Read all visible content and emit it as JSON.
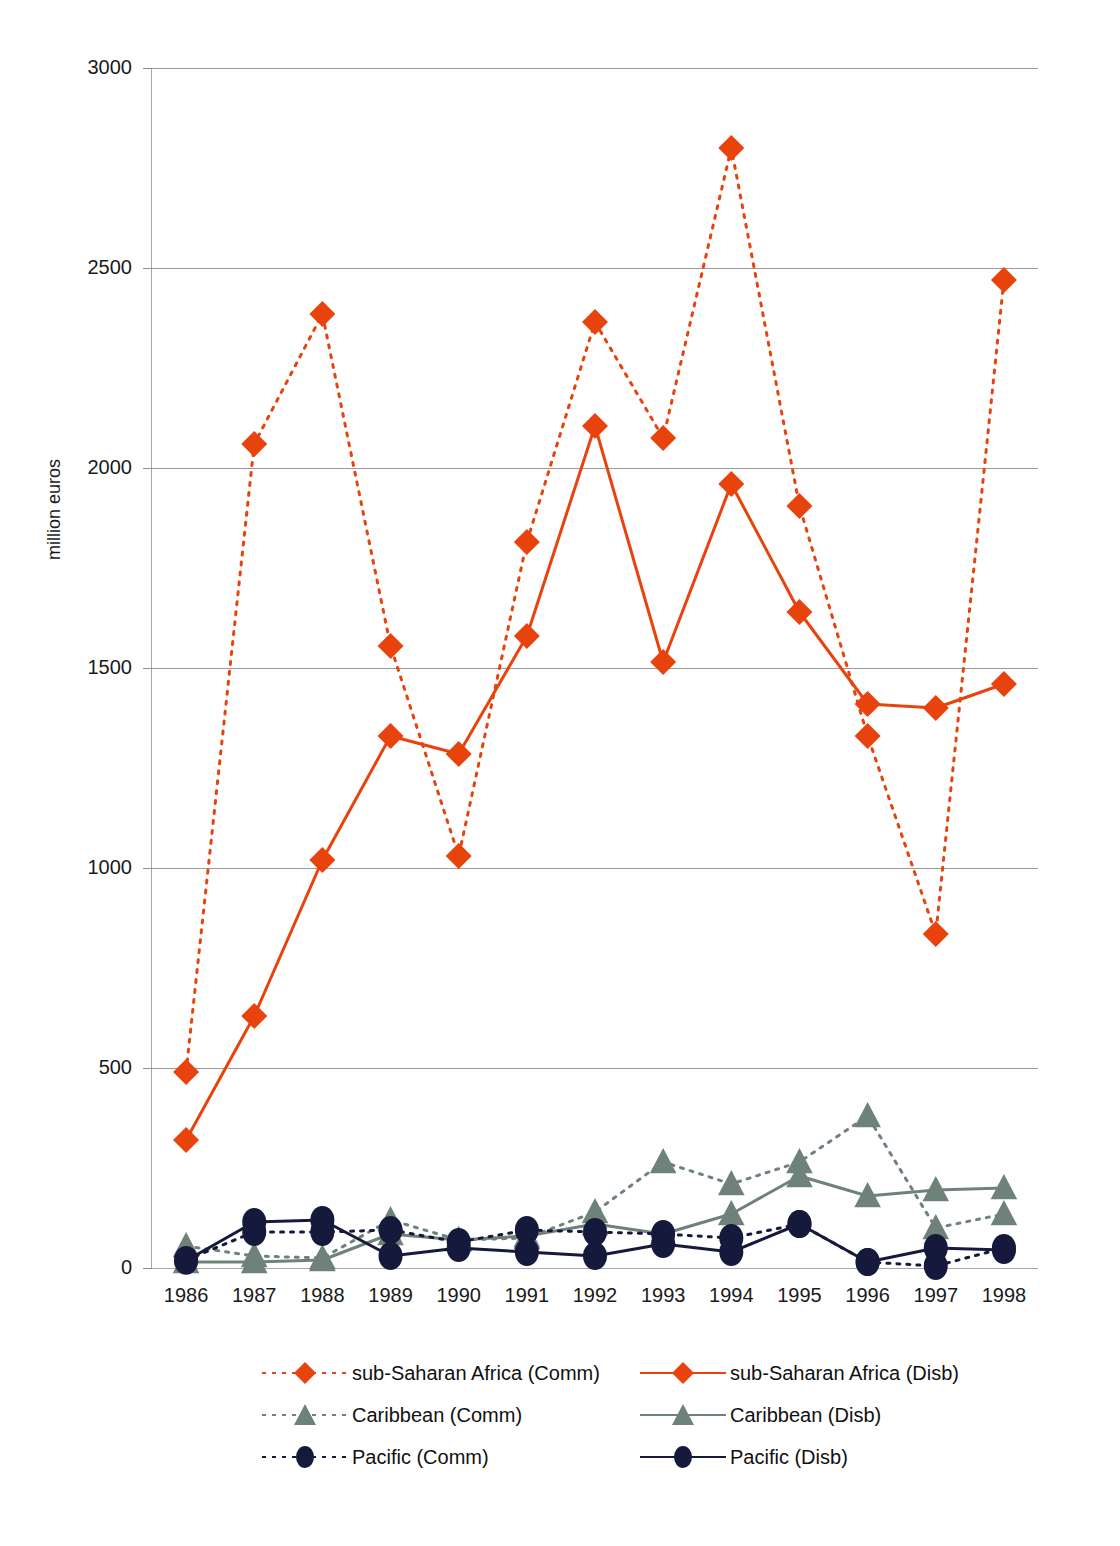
{
  "chart_data": {
    "type": "line",
    "title": "",
    "xlabel": "",
    "ylabel": "million euros",
    "ylim": [
      0,
      3000
    ],
    "ytick_step": 500,
    "yticks": [
      0,
      500,
      1000,
      1500,
      2000,
      2500,
      3000
    ],
    "grid": "horizontal",
    "legend_position": "bottom",
    "categories": [
      "1986",
      "1987",
      "1988",
      "1989",
      "1990",
      "1991",
      "1992",
      "1993",
      "1994",
      "1995",
      "1996",
      "1997",
      "1998"
    ],
    "series": [
      {
        "name": "sub-Saharan Africa (Comm)",
        "style": "dotted",
        "marker": "diamond",
        "color": "#e8430d",
        "values": [
          490,
          2060,
          2385,
          1555,
          1030,
          1815,
          2365,
          2075,
          2800,
          1905,
          1330,
          835,
          2470
        ]
      },
      {
        "name": "sub-Saharan Africa (Disb)",
        "style": "solid",
        "marker": "diamond",
        "color": "#e8430d",
        "values": [
          320,
          630,
          1020,
          1330,
          1285,
          1580,
          2105,
          1515,
          1960,
          1640,
          1410,
          1400,
          1460
        ]
      },
      {
        "name": "Caribbean (Comm)",
        "style": "dotted",
        "marker": "triangle",
        "color": "#6e8279",
        "values": [
          55,
          30,
          25,
          120,
          70,
          75,
          140,
          265,
          210,
          265,
          380,
          100,
          135
        ]
      },
      {
        "name": "Caribbean (Disb)",
        "style": "solid",
        "marker": "triangle",
        "color": "#6e8279",
        "values": [
          15,
          15,
          20,
          85,
          70,
          80,
          110,
          85,
          135,
          230,
          180,
          195,
          200
        ]
      },
      {
        "name": "Pacific (Comm)",
        "style": "dotted",
        "marker": "circle",
        "color": "#151a3d",
        "values": [
          20,
          90,
          90,
          95,
          65,
          95,
          90,
          85,
          75,
          110,
          15,
          5,
          50
        ]
      },
      {
        "name": "Pacific (Disb)",
        "style": "solid",
        "marker": "circle",
        "color": "#151a3d",
        "values": [
          18,
          115,
          120,
          30,
          50,
          40,
          30,
          60,
          40,
          110,
          15,
          50,
          45
        ]
      }
    ]
  },
  "legend": {
    "rows": [
      {
        "left": "sub-Saharan Africa (Comm)",
        "right": "sub-Saharan Africa (Disb)"
      },
      {
        "left": "Caribbean (Comm)",
        "right": "Caribbean (Disb)"
      },
      {
        "left": "Pacific (Comm)",
        "right": "Pacific (Disb)"
      }
    ]
  },
  "colors": {
    "sub_saharan": "#e8430d",
    "caribbean": "#6e8279",
    "pacific": "#151a3d",
    "grid": "#9a9a9a",
    "axis": "#a8a8a8",
    "text": "#1a1a1a"
  }
}
